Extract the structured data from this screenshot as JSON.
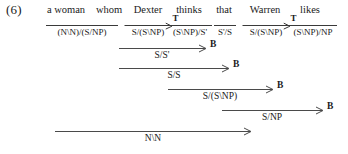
{
  "figure": {
    "example_number": "(6)",
    "type": "ccg-derivation"
  },
  "lexicon": [
    {
      "word": "a woman",
      "category": "(N\\N)/(S/NP)",
      "rule": "",
      "center": 82,
      "bar_width": 72,
      "word_center": 66
    },
    {
      "word": "whom",
      "category": "",
      "rule": "",
      "center": 109,
      "bar_width": 0,
      "word_center": 109
    },
    {
      "word": "Dexter",
      "category": "S/(S\\NP)",
      "rule": "T",
      "center": 148,
      "bar_width": 47,
      "word_center": 148
    },
    {
      "word": "thinks",
      "category": "(S\\NP)/S'",
      "rule": "",
      "center": 190,
      "bar_width": 44,
      "word_center": 189
    },
    {
      "word": "that",
      "category": "S'/S",
      "rule": "",
      "center": 225,
      "bar_width": 22,
      "word_center": 224
    },
    {
      "word": "Warren",
      "category": "S/(S\\NP)",
      "rule": "T",
      "center": 266,
      "bar_width": 47,
      "word_center": 265
    },
    {
      "word": "likes",
      "category": "(S\\NP)/NP",
      "rule": "",
      "center": 313,
      "bar_width": 48,
      "word_center": 310
    }
  ],
  "lexical_bar": {
    "woman_whom_left": 46,
    "woman_whom_right": 118
  },
  "derivations": [
    {
      "result": "S/S'",
      "rule": "B",
      "left": 119,
      "right": 205,
      "top": 48,
      "label_x": 210
    },
    {
      "result": "S/S",
      "rule": "B",
      "left": 119,
      "right": 228,
      "top": 68,
      "label_x": 233
    },
    {
      "result": "S/(S\\NP)",
      "rule": "B",
      "left": 168,
      "right": 272,
      "top": 89,
      "label_x": 277
    },
    {
      "result": "S/NP",
      "rule": "B",
      "left": 222,
      "right": 322,
      "top": 110,
      "label_x": 327
    },
    {
      "result": "N\\N",
      "rule": "",
      "left": 55,
      "right": 250,
      "top": 131,
      "label_x": 255
    }
  ],
  "colors": {
    "ink": "#1a1a1a",
    "rule_line": "#4a4a4a",
    "page": "#ffffff"
  }
}
